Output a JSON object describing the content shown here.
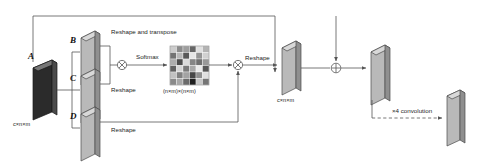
{
  "diagram": {
    "tensors": {
      "a": {
        "label": "A",
        "dim_label": "c×n×m"
      },
      "b": {
        "label": "B"
      },
      "c": {
        "label": "C"
      },
      "d": {
        "label": "D"
      },
      "out_attention": {
        "dim_label": "c×n×m"
      },
      "attention_map": {
        "dim_label": "(n×m)×(n×m)"
      }
    },
    "operations": {
      "reshape_transpose": "Reshape and transpose",
      "reshape_mid": "Reshape",
      "reshape_bottom": "Reshape",
      "softmax": "Softmax",
      "reshape_right": "Reshape",
      "convolution": "×4 convolution",
      "matmul_symbol": "⊗",
      "add_symbol": "⊕"
    },
    "colors": {
      "tensor_a_fill": "#2b2b2b",
      "tensor_face": "#b9b9b9",
      "tensor_top": "#d8d8d8",
      "tensor_side": "#8f8f8f",
      "stroke": "#4a4a4a",
      "line": "#555555",
      "text": "#1c1c1c"
    },
    "attention_matrix": {
      "rows": 6,
      "cols": 6,
      "values": [
        [
          0.8,
          0.55,
          0.62,
          0.4,
          0.88,
          0.7
        ],
        [
          0.45,
          0.72,
          0.35,
          0.9,
          0.58,
          0.82
        ],
        [
          0.68,
          0.3,
          0.86,
          0.52,
          0.44,
          0.6
        ],
        [
          0.38,
          0.84,
          0.48,
          0.66,
          0.92,
          0.34
        ],
        [
          0.76,
          0.5,
          0.64,
          0.28,
          0.56,
          0.88
        ],
        [
          0.54,
          0.66,
          0.42,
          0.12,
          0.78,
          0.46
        ]
      ]
    }
  }
}
